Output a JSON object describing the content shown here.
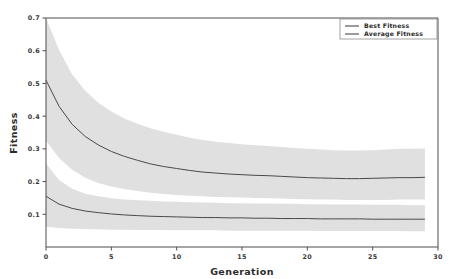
{
  "chart_data": {
    "type": "line",
    "title": "",
    "xlabel": "Generation",
    "ylabel": "Fitness",
    "xlim": [
      0,
      30
    ],
    "ylim": [
      0.0,
      0.7
    ],
    "xticks": [
      0,
      5,
      10,
      15,
      20,
      25,
      30
    ],
    "xtick_labels": [
      "0",
      "5",
      "10",
      "15",
      "20",
      "25",
      "30"
    ],
    "yticks": [
      0.1,
      0.2,
      0.3,
      0.4,
      0.5,
      0.6,
      0.7
    ],
    "ytick_labels": [
      "0.1",
      "0.2",
      "0.3",
      "0.4",
      "0.5",
      "0.6",
      "0.7"
    ],
    "grid": false,
    "legend_position": "top-right",
    "band_style": "std-dev shaded region",
    "band_color": "#d9d9d9",
    "x": [
      0,
      1,
      2,
      3,
      4,
      5,
      6,
      7,
      8,
      9,
      10,
      11,
      12,
      13,
      14,
      15,
      16,
      17,
      18,
      19,
      20,
      21,
      22,
      23,
      24,
      25,
      26,
      27,
      28,
      29
    ],
    "series": [
      {
        "name": "Best Fitness",
        "color": "#4a4a4a",
        "values": [
          0.155,
          0.131,
          0.118,
          0.11,
          0.105,
          0.101,
          0.098,
          0.096,
          0.094,
          0.093,
          0.092,
          0.091,
          0.09,
          0.09,
          0.089,
          0.089,
          0.088,
          0.088,
          0.087,
          0.087,
          0.087,
          0.086,
          0.086,
          0.086,
          0.086,
          0.085,
          0.085,
          0.085,
          0.085,
          0.085
        ],
        "band_upper": [
          0.255,
          0.205,
          0.178,
          0.163,
          0.155,
          0.149,
          0.145,
          0.143,
          0.141,
          0.139,
          0.138,
          0.137,
          0.136,
          0.135,
          0.134,
          0.134,
          0.133,
          0.133,
          0.132,
          0.132,
          0.131,
          0.131,
          0.13,
          0.13,
          0.13,
          0.129,
          0.129,
          0.129,
          0.128,
          0.128
        ],
        "band_lower": [
          0.062,
          0.058,
          0.056,
          0.055,
          0.054,
          0.053,
          0.053,
          0.052,
          0.052,
          0.052,
          0.051,
          0.051,
          0.051,
          0.051,
          0.05,
          0.05,
          0.05,
          0.05,
          0.05,
          0.05,
          0.05,
          0.049,
          0.049,
          0.049,
          0.049,
          0.049,
          0.049,
          0.049,
          0.048,
          0.048
        ]
      },
      {
        "name": "Average Fitness",
        "color": "#4a4a4a",
        "values": [
          0.51,
          0.43,
          0.375,
          0.338,
          0.312,
          0.292,
          0.277,
          0.265,
          0.254,
          0.246,
          0.24,
          0.234,
          0.229,
          0.226,
          0.223,
          0.221,
          0.219,
          0.218,
          0.216,
          0.214,
          0.212,
          0.211,
          0.21,
          0.209,
          0.209,
          0.21,
          0.211,
          0.212,
          0.212,
          0.213
        ],
        "band_upper": [
          0.7,
          0.602,
          0.528,
          0.478,
          0.441,
          0.414,
          0.393,
          0.377,
          0.363,
          0.352,
          0.343,
          0.334,
          0.327,
          0.322,
          0.318,
          0.314,
          0.311,
          0.309,
          0.306,
          0.303,
          0.3,
          0.298,
          0.296,
          0.295,
          0.295,
          0.296,
          0.298,
          0.3,
          0.3,
          0.301
        ],
        "band_lower": [
          0.325,
          0.272,
          0.236,
          0.212,
          0.196,
          0.185,
          0.177,
          0.171,
          0.166,
          0.162,
          0.159,
          0.157,
          0.155,
          0.153,
          0.152,
          0.151,
          0.15,
          0.149,
          0.148,
          0.147,
          0.146,
          0.145,
          0.145,
          0.144,
          0.144,
          0.144,
          0.144,
          0.145,
          0.145,
          0.145
        ]
      }
    ],
    "legend": [
      {
        "label": "Best Fitness",
        "color": "#4a4a4a"
      },
      {
        "label": "Average Fitness",
        "color": "#4a4a4a"
      }
    ]
  }
}
